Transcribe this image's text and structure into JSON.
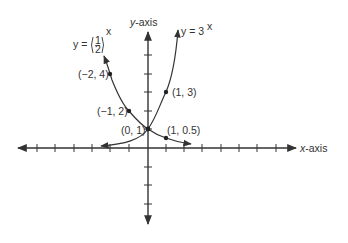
{
  "axes": {
    "x_label_italic": "x",
    "x_label_rest": "-axis",
    "y_label_italic": "y",
    "y_label_rest": "-axis"
  },
  "curves": [
    {
      "name": "y = 3^x",
      "label_main": "y = 3",
      "label_sup": "x"
    },
    {
      "name": "y = (1/2)^x",
      "label_main": "y = ",
      "label_num": "1",
      "label_den": "2",
      "label_sup": "x"
    }
  ],
  "points": [
    {
      "label": "(−2, 4)"
    },
    {
      "label": "(−1, 2)"
    },
    {
      "label": "(0, 1)"
    },
    {
      "label": "(1, 3)"
    },
    {
      "label": "(1, 0.5)"
    }
  ],
  "colors": {
    "ink": "#333333",
    "background": "#ffffff"
  }
}
